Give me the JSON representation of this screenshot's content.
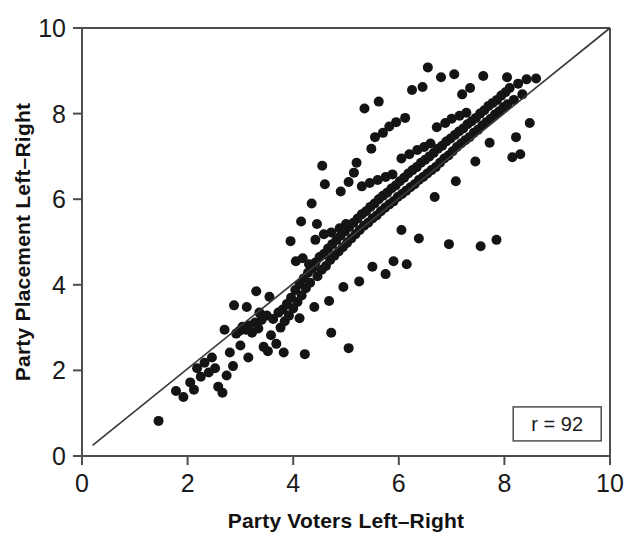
{
  "chart_data": {
    "type": "scatter",
    "title": "",
    "xlabel": "Party Voters Left–Right",
    "ylabel": "Party Placement Left–Right",
    "xlim": [
      0,
      10
    ],
    "ylim": [
      0,
      10
    ],
    "xticks": [
      0,
      2,
      4,
      6,
      8,
      10
    ],
    "yticks": [
      0,
      2,
      4,
      6,
      8,
      10
    ],
    "xtick_labels": [
      "0",
      "2",
      "4",
      "6",
      "8",
      "10"
    ],
    "ytick_labels": [
      "0",
      "2",
      "4",
      "6",
      "8",
      "10"
    ],
    "grid": false,
    "legend": null,
    "annotations": [
      {
        "name": "correlation-box",
        "text": "r = 92",
        "x": 9.0,
        "y": 0.75,
        "boxed": true
      }
    ],
    "fit_line": {
      "name": "regression-line",
      "x": [
        0.2,
        10.0
      ],
      "y": [
        0.25,
        10.0
      ],
      "color": "#3a3a3a"
    },
    "marker": {
      "shape": "circle",
      "color": "#141414",
      "size": 9
    },
    "points": [
      [
        1.45,
        0.82
      ],
      [
        1.78,
        1.52
      ],
      [
        1.92,
        1.38
      ],
      [
        2.05,
        1.72
      ],
      [
        2.12,
        1.55
      ],
      [
        2.18,
        2.05
      ],
      [
        2.25,
        1.85
      ],
      [
        2.32,
        2.18
      ],
      [
        2.4,
        1.95
      ],
      [
        2.46,
        2.3
      ],
      [
        2.52,
        2.05
      ],
      [
        2.58,
        1.62
      ],
      [
        2.66,
        1.48
      ],
      [
        2.74,
        1.88
      ],
      [
        2.8,
        2.42
      ],
      [
        2.86,
        2.1
      ],
      [
        2.92,
        2.86
      ],
      [
        2.98,
        2.92
      ],
      [
        3.04,
        3.02
      ],
      [
        3.1,
        2.95
      ],
      [
        3.16,
        3.05
      ],
      [
        3.22,
        2.88
      ],
      [
        3.28,
        3.12
      ],
      [
        3.34,
        2.98
      ],
      [
        3.4,
        3.18
      ],
      [
        3.12,
        3.48
      ],
      [
        3.36,
        3.35
      ],
      [
        3.5,
        3.28
      ],
      [
        3.44,
        2.55
      ],
      [
        3.52,
        2.45
      ],
      [
        3.58,
        2.82
      ],
      [
        3.62,
        3.2
      ],
      [
        3.68,
        2.62
      ],
      [
        3.72,
        3.35
      ],
      [
        3.76,
        3.0
      ],
      [
        3.8,
        3.42
      ],
      [
        3.84,
        3.15
      ],
      [
        3.88,
        3.55
      ],
      [
        3.92,
        3.28
      ],
      [
        3.96,
        3.7
      ],
      [
        4.0,
        3.45
      ],
      [
        4.04,
        3.88
      ],
      [
        4.08,
        3.6
      ],
      [
        4.12,
        4.02
      ],
      [
        4.16,
        3.75
      ],
      [
        4.2,
        4.15
      ],
      [
        4.24,
        3.92
      ],
      [
        4.28,
        4.28
      ],
      [
        4.32,
        4.05
      ],
      [
        4.36,
        4.38
      ],
      [
        4.05,
        4.55
      ],
      [
        4.18,
        4.62
      ],
      [
        4.3,
        4.48
      ],
      [
        4.42,
        4.52
      ],
      [
        4.46,
        4.2
      ],
      [
        4.5,
        4.65
      ],
      [
        4.54,
        4.35
      ],
      [
        4.58,
        4.72
      ],
      [
        4.62,
        4.44
      ],
      [
        4.66,
        4.85
      ],
      [
        4.7,
        4.58
      ],
      [
        4.74,
        4.95
      ],
      [
        4.78,
        4.68
      ],
      [
        4.82,
        5.05
      ],
      [
        4.86,
        4.78
      ],
      [
        4.9,
        5.15
      ],
      [
        4.94,
        4.88
      ],
      [
        4.98,
        5.25
      ],
      [
        5.02,
        4.98
      ],
      [
        5.06,
        5.35
      ],
      [
        4.42,
        5.05
      ],
      [
        4.58,
        5.18
      ],
      [
        4.72,
        5.22
      ],
      [
        4.88,
        5.32
      ],
      [
        5.0,
        5.42
      ],
      [
        5.1,
        5.08
      ],
      [
        5.14,
        5.45
      ],
      [
        5.18,
        5.18
      ],
      [
        5.22,
        5.55
      ],
      [
        5.26,
        5.28
      ],
      [
        5.3,
        5.65
      ],
      [
        5.34,
        5.38
      ],
      [
        5.38,
        5.72
      ],
      [
        5.42,
        5.45
      ],
      [
        5.46,
        5.82
      ],
      [
        5.5,
        5.55
      ],
      [
        5.54,
        5.9
      ],
      [
        5.58,
        5.62
      ],
      [
        5.62,
        6.0
      ],
      [
        5.66,
        5.72
      ],
      [
        5.7,
        6.08
      ],
      [
        5.74,
        5.8
      ],
      [
        5.78,
        6.15
      ],
      [
        5.82,
        5.88
      ],
      [
        5.86,
        6.25
      ],
      [
        5.3,
        6.3
      ],
      [
        5.45,
        6.38
      ],
      [
        5.6,
        6.45
      ],
      [
        5.75,
        6.52
      ],
      [
        5.88,
        6.58
      ],
      [
        5.9,
        5.95
      ],
      [
        5.94,
        6.32
      ],
      [
        5.98,
        6.05
      ],
      [
        6.02,
        6.42
      ],
      [
        6.06,
        6.12
      ],
      [
        6.1,
        6.5
      ],
      [
        6.14,
        6.2
      ],
      [
        6.18,
        6.6
      ],
      [
        6.22,
        6.28
      ],
      [
        6.26,
        6.68
      ],
      [
        6.3,
        6.35
      ],
      [
        6.34,
        6.75
      ],
      [
        6.38,
        6.45
      ],
      [
        6.42,
        6.85
      ],
      [
        6.46,
        6.52
      ],
      [
        6.5,
        6.92
      ],
      [
        6.54,
        6.6
      ],
      [
        6.58,
        7.0
      ],
      [
        6.62,
        6.68
      ],
      [
        6.66,
        7.08
      ],
      [
        6.05,
        6.95
      ],
      [
        6.2,
        7.05
      ],
      [
        6.35,
        7.15
      ],
      [
        6.48,
        7.22
      ],
      [
        6.6,
        7.3
      ],
      [
        6.7,
        6.75
      ],
      [
        6.74,
        7.18
      ],
      [
        6.78,
        6.85
      ],
      [
        6.82,
        7.25
      ],
      [
        6.86,
        6.95
      ],
      [
        6.9,
        7.35
      ],
      [
        6.94,
        7.02
      ],
      [
        6.98,
        7.42
      ],
      [
        7.02,
        7.12
      ],
      [
        7.06,
        7.5
      ],
      [
        7.1,
        7.22
      ],
      [
        7.14,
        7.58
      ],
      [
        7.18,
        7.3
      ],
      [
        7.22,
        7.65
      ],
      [
        7.26,
        7.38
      ],
      [
        7.3,
        7.75
      ],
      [
        7.34,
        7.45
      ],
      [
        7.38,
        7.82
      ],
      [
        7.42,
        7.55
      ],
      [
        7.46,
        7.9
      ],
      [
        6.72,
        7.68
      ],
      [
        6.88,
        7.78
      ],
      [
        7.0,
        7.88
      ],
      [
        7.15,
        7.95
      ],
      [
        7.28,
        8.02
      ],
      [
        7.5,
        7.62
      ],
      [
        7.54,
        8.0
      ],
      [
        7.58,
        7.72
      ],
      [
        7.62,
        8.08
      ],
      [
        7.66,
        7.8
      ],
      [
        7.7,
        8.18
      ],
      [
        7.74,
        7.88
      ],
      [
        7.78,
        8.25
      ],
      [
        7.82,
        7.98
      ],
      [
        7.86,
        8.32
      ],
      [
        7.9,
        8.05
      ],
      [
        7.94,
        8.42
      ],
      [
        7.98,
        8.15
      ],
      [
        8.02,
        8.5
      ],
      [
        8.06,
        8.22
      ],
      [
        8.1,
        8.6
      ],
      [
        8.18,
        8.32
      ],
      [
        8.26,
        8.7
      ],
      [
        8.34,
        8.45
      ],
      [
        8.42,
        8.8
      ],
      [
        5.55,
        7.45
      ],
      [
        5.7,
        7.55
      ],
      [
        5.82,
        7.7
      ],
      [
        5.95,
        7.8
      ],
      [
        6.12,
        7.9
      ],
      [
        5.35,
        8.12
      ],
      [
        5.62,
        8.28
      ],
      [
        5.48,
        7.18
      ],
      [
        5.2,
        6.85
      ],
      [
        5.05,
        6.4
      ],
      [
        4.6,
        6.35
      ],
      [
        4.35,
        5.9
      ],
      [
        4.15,
        5.48
      ],
      [
        3.95,
        5.02
      ],
      [
        4.45,
        5.42
      ],
      [
        6.25,
        8.55
      ],
      [
        6.45,
        8.62
      ],
      [
        6.8,
        8.85
      ],
      [
        7.05,
        8.92
      ],
      [
        7.35,
        8.6
      ],
      [
        6.55,
        9.08
      ],
      [
        7.2,
        8.45
      ],
      [
        7.6,
        8.88
      ],
      [
        8.05,
        8.85
      ],
      [
        8.6,
        8.82
      ],
      [
        8.48,
        7.78
      ],
      [
        8.3,
        7.05
      ],
      [
        8.15,
        6.98
      ],
      [
        7.85,
        5.05
      ],
      [
        7.55,
        4.9
      ],
      [
        6.95,
        4.95
      ],
      [
        6.38,
        5.08
      ],
      [
        6.05,
        5.28
      ],
      [
        5.9,
        4.55
      ],
      [
        6.15,
        4.48
      ],
      [
        5.75,
        4.25
      ],
      [
        5.5,
        4.42
      ],
      [
        5.25,
        4.08
      ],
      [
        4.95,
        3.95
      ],
      [
        4.68,
        3.62
      ],
      [
        4.4,
        3.48
      ],
      [
        4.12,
        3.22
      ],
      [
        3.82,
        2.42
      ],
      [
        4.22,
        2.38
      ],
      [
        3.15,
        2.3
      ],
      [
        2.7,
        2.95
      ],
      [
        3.0,
        2.58
      ],
      [
        3.55,
        3.72
      ],
      [
        3.3,
        3.85
      ],
      [
        2.88,
        3.52
      ],
      [
        4.55,
        6.78
      ],
      [
        4.9,
        6.18
      ],
      [
        5.15,
        6.62
      ],
      [
        6.68,
        6.05
      ],
      [
        7.08,
        6.42
      ],
      [
        7.45,
        6.88
      ],
      [
        7.72,
        7.32
      ],
      [
        8.22,
        7.45
      ],
      [
        5.05,
        2.52
      ],
      [
        4.72,
        2.88
      ]
    ]
  },
  "plot_geometry": {
    "left": 82,
    "top": 28,
    "right": 610,
    "bottom": 456
  }
}
